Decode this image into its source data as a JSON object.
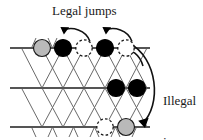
{
  "figure": {
    "background": "#ffffff",
    "width": 203,
    "height": 140
  },
  "labels": {
    "legal_jumps": "Legal jumps",
    "illegal_jump_line1": "Illegal",
    "illegal_jump_line2": "jump"
  },
  "colors": {
    "line": "#555555",
    "lattice_diagonal": "#6a6a6a",
    "black_site": "#000000",
    "gray_site": "#b9b9b9",
    "empty_site": "#ffffff",
    "stroke": "#1a1a1a",
    "text": "#1a1a1a"
  },
  "lattice": {
    "rows": [
      {
        "name": "top-row",
        "y": 48,
        "x_start": 10,
        "x_end": 150
      },
      {
        "name": "middle-row",
        "y": 88,
        "x_start": 10,
        "x_end": 150
      },
      {
        "name": "bottom-row",
        "y": 127,
        "x_start": 10,
        "x_end": 150
      }
    ],
    "column_spacing": 21,
    "first_column_x": 42
  },
  "sites": [
    {
      "name": "site-top-1",
      "row": "top",
      "x": 42,
      "y": 48,
      "fill": "gray",
      "dashed": false
    },
    {
      "name": "site-top-2",
      "row": "top",
      "x": 63,
      "y": 48,
      "fill": "black",
      "dashed": false
    },
    {
      "name": "site-top-3",
      "row": "top",
      "x": 84,
      "y": 48,
      "fill": "empty",
      "dashed": true
    },
    {
      "name": "site-top-4",
      "row": "top",
      "x": 105,
      "y": 48,
      "fill": "black",
      "dashed": false
    },
    {
      "name": "site-top-5",
      "row": "top",
      "x": 126,
      "y": 48,
      "fill": "empty",
      "dashed": true
    },
    {
      "name": "site-mid-1",
      "row": "middle",
      "x": 116,
      "y": 88,
      "fill": "black",
      "dashed": false
    },
    {
      "name": "site-mid-2",
      "row": "middle",
      "x": 137,
      "y": 88,
      "fill": "black",
      "dashed": false
    },
    {
      "name": "site-bot-1",
      "row": "bottom",
      "x": 105,
      "y": 127,
      "fill": "empty",
      "dashed": true
    },
    {
      "name": "site-bot-2",
      "row": "bottom",
      "x": 126,
      "y": 127,
      "fill": "gray",
      "dashed": false
    }
  ],
  "arrows": [
    {
      "name": "legal-jump-arrow-1",
      "kind": "legal",
      "from_x": 84,
      "from_y": 42,
      "to_x": 63,
      "to_y": 40
    },
    {
      "name": "legal-jump-arrow-2",
      "kind": "legal",
      "from_x": 126,
      "from_y": 42,
      "to_x": 105,
      "to_y": 40
    },
    {
      "name": "legal-jump-arrow-3",
      "kind": "legal",
      "from_x": 137,
      "from_y": 60,
      "to_x": 121,
      "to_y": 58
    },
    {
      "name": "illegal-jump-arrow",
      "kind": "illegal",
      "from_x": 130,
      "from_y": 44,
      "to_x": 140,
      "to_y": 126
    }
  ],
  "site_radius": 8.5
}
